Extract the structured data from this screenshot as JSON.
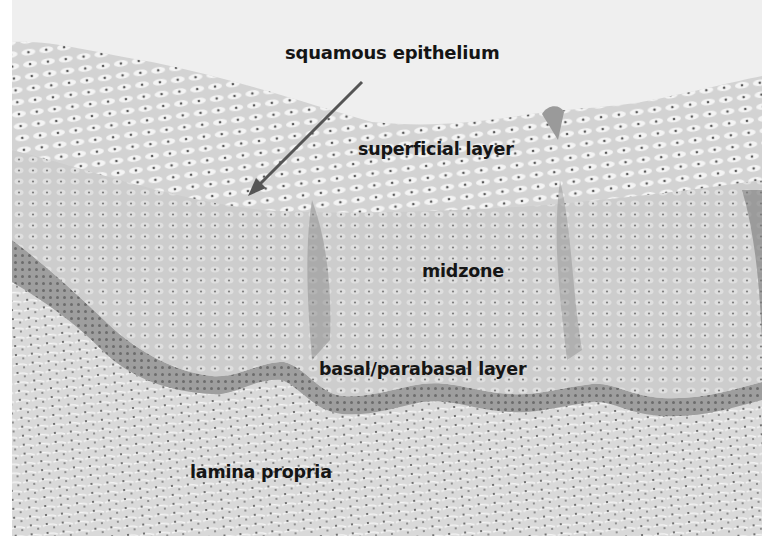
{
  "figure": {
    "type": "histology-micrograph",
    "stain_appearance": "grayscale",
    "colors": {
      "background": "#ececec",
      "lumen": "#efefef",
      "superficial": "#dadada",
      "midzone": "#cfcfcf",
      "basal": "#a9a9a9",
      "lamina_propria": "#d9d9d9",
      "nuclei": "#3a3a3a",
      "label_text": "#151515",
      "arrow": "#555555"
    }
  },
  "labels": {
    "squamous_epithelium": "squamous epithelium",
    "superficial_layer": "superficial layer",
    "midzone": "midzone",
    "basal_parabasal_layer": "basal/parabasal layer",
    "lamina_propria": "lamina propria"
  },
  "arrow": {
    "from": [
      362,
      82
    ],
    "to": [
      250,
      190
    ],
    "points_to": "squamous epithelium"
  }
}
